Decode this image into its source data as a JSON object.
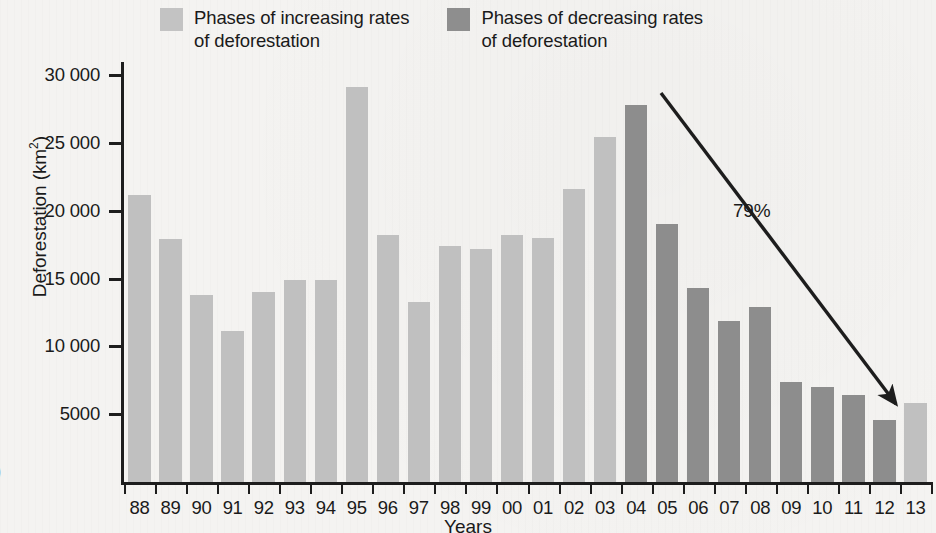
{
  "figure": {
    "letter_fragment": ")"
  },
  "legend": {
    "position": "top",
    "items": [
      {
        "label": "Phases of increasing rates\nof deforestation",
        "color": "#c0c0c0",
        "key": "increasing"
      },
      {
        "label": "Phases of decreasing rates\nof deforestation",
        "color": "#8d8d8d",
        "key": "decreasing"
      }
    ]
  },
  "annotation": {
    "percent_label": "79%",
    "arrow": {
      "from_year": "04",
      "to_year": "13"
    }
  },
  "chart_data": {
    "type": "bar",
    "title": "",
    "xlabel": "Years",
    "ylabel": "Deforestation (km²)",
    "ylim": [
      0,
      32000
    ],
    "grid": false,
    "y_ticks": [
      5000,
      10000,
      15000,
      20000,
      25000,
      30000
    ],
    "y_tick_labels": [
      "5000",
      "10 000",
      "15 000",
      "20 000",
      "25 000",
      "30 000"
    ],
    "categories": [
      "88",
      "89",
      "90",
      "91",
      "92",
      "93",
      "94",
      "95",
      "96",
      "97",
      "98",
      "99",
      "00",
      "01",
      "02",
      "03",
      "04",
      "05",
      "06",
      "07",
      "08",
      "09",
      "10",
      "11",
      "12",
      "13"
    ],
    "values": [
      21150,
      17900,
      13800,
      11100,
      14000,
      14900,
      14900,
      29100,
      18200,
      13300,
      17400,
      17200,
      18200,
      18000,
      21600,
      25400,
      27800,
      19000,
      14300,
      11900,
      12900,
      7400,
      7000,
      6400,
      4600,
      5800
    ],
    "series": [
      {
        "name": "Phases of increasing rates of deforestation",
        "color": "#c0c0c0",
        "categories": [
          "88",
          "89",
          "90",
          "91",
          "92",
          "93",
          "94",
          "95",
          "96",
          "97",
          "98",
          "99",
          "00",
          "01",
          "02",
          "03",
          "13"
        ]
      },
      {
        "name": "Phases of decreasing rates of deforestation",
        "color": "#8d8d8d",
        "categories": [
          "04",
          "05",
          "06",
          "07",
          "08",
          "09",
          "10",
          "11",
          "12"
        ]
      }
    ],
    "bar_phase": [
      "inc",
      "inc",
      "inc",
      "inc",
      "inc",
      "inc",
      "inc",
      "inc",
      "inc",
      "inc",
      "inc",
      "inc",
      "inc",
      "inc",
      "inc",
      "inc",
      "dec",
      "dec",
      "dec",
      "dec",
      "dec",
      "dec",
      "dec",
      "dec",
      "dec",
      "inc"
    ]
  },
  "colors": {
    "increasing": "#c0c0c0",
    "decreasing": "#8d8d8d",
    "axis": "#1d1d1d",
    "background": "#f4f3f1"
  }
}
